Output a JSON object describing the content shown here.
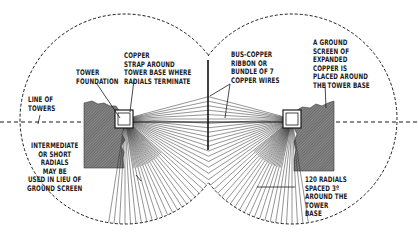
{
  "diagram": {
    "type": "ground-radial-system-plan",
    "colors": {
      "line": "#1a1a1a",
      "hatch": "#6e6e6e",
      "hatch_light": "#9a9a9a",
      "background": "#ffffff"
    },
    "labels": {
      "line_of_towers": "LINE OF\nTOWERS",
      "tower_foundation": "TOWER\nFOUNDATION",
      "copper_strap": "COPPER\nSTRAP AROUND\nTOWER BASE WHERE\nRADIALS TERMINATE",
      "bus_copper": "BUS-COPPER\nRIBBON OR\nBUNDLE OF 7\nCOPPER WIRES",
      "ground_screen": "A GROUND\nSCREEN OF\nEXPANDED\nCOPPER IS\nPLACED AROUND\nTHE TOWER BASE",
      "intermediate_radials": "INTERMEDIATE\nOR SHORT\nRADIALS\nMAY BE\nUSED IN LIEU OF\nGROUND SCREEN",
      "radials_spacing": "120 RADIALS\nSPACED 3º\nAROUND THE\nTOWER\nBASE"
    },
    "towers": [
      {
        "name": "left-tower",
        "cx": 125,
        "cy": 119,
        "radius": 105
      },
      {
        "name": "right-tower",
        "cx": 292,
        "cy": 119,
        "radius": 105
      }
    ],
    "radial_count": 120,
    "radial_spacing_degrees": 3
  }
}
